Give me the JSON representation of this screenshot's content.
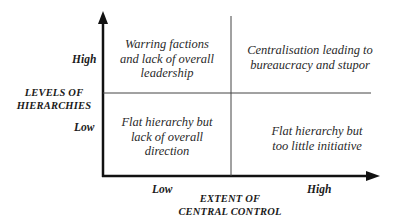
{
  "diagram": {
    "y_axis": {
      "title_line1": "LEVELS OF",
      "title_line2": "HIERARCHIES",
      "high_label": "High",
      "low_label": "Low"
    },
    "x_axis": {
      "title_line1": "EXTENT OF",
      "title_line2": "CENTRAL CONTROL",
      "low_label": "Low",
      "high_label": "High"
    },
    "quadrants": {
      "top_left": [
        "Warring factions",
        "and lack of overall",
        "leadership"
      ],
      "top_right": [
        "Centralisation leading to",
        "bureaucracy and stupor"
      ],
      "bottom_left": [
        "Flat hierarchy but",
        "lack of overall",
        "direction"
      ],
      "bottom_right": [
        "Flat hierarchy but",
        "too little initiative"
      ]
    },
    "colors": {
      "axis": "#111111",
      "divider": "#444444",
      "text": "#1a1a1a"
    }
  }
}
